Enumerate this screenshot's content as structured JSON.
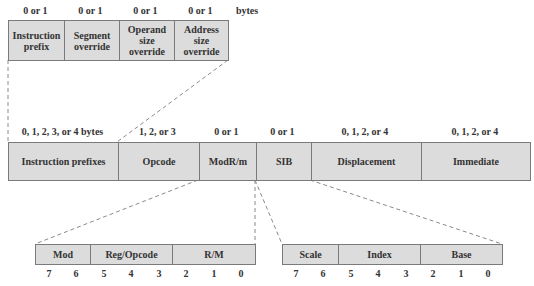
{
  "prefix_detail": {
    "size_labels": [
      "0 or 1",
      "0 or 1",
      "0 or 1",
      "0 or 1"
    ],
    "unit_label": "bytes",
    "fields": [
      {
        "name": "Instruction prefix",
        "lines": [
          "Instruction",
          "prefix"
        ]
      },
      {
        "name": "Segment override",
        "lines": [
          "Segment",
          "override"
        ]
      },
      {
        "name": "Operand size override",
        "lines": [
          "Operand",
          "size",
          "override"
        ]
      },
      {
        "name": "Address size override",
        "lines": [
          "Address",
          "size",
          "override"
        ]
      }
    ]
  },
  "instruction_format": {
    "size_labels": [
      "0, 1, 2, 3, or 4 bytes",
      "1, 2, or 3",
      "0 or 1",
      "0 or 1",
      "0, 1, 2, or 4",
      "0, 1, 2, or 4"
    ],
    "fields": [
      "Instruction prefixes",
      "Opcode",
      "ModR/m",
      "SIB",
      "Displacement",
      "Immediate"
    ]
  },
  "modrm_detail": {
    "fields": [
      "Mod",
      "Reg/Opcode",
      "R/M"
    ],
    "bits": [
      "7",
      "6",
      "5",
      "4",
      "3",
      "2",
      "1",
      "0"
    ]
  },
  "sib_detail": {
    "fields": [
      "Scale",
      "Index",
      "Base"
    ],
    "bits": [
      "7",
      "6",
      "5",
      "4",
      "3",
      "2",
      "1",
      "0"
    ]
  },
  "colors": {
    "field_fill": "#dcdcdc",
    "border": "#7a7a7a",
    "dashed_line": "#8a8a8a",
    "text": "#333333"
  }
}
